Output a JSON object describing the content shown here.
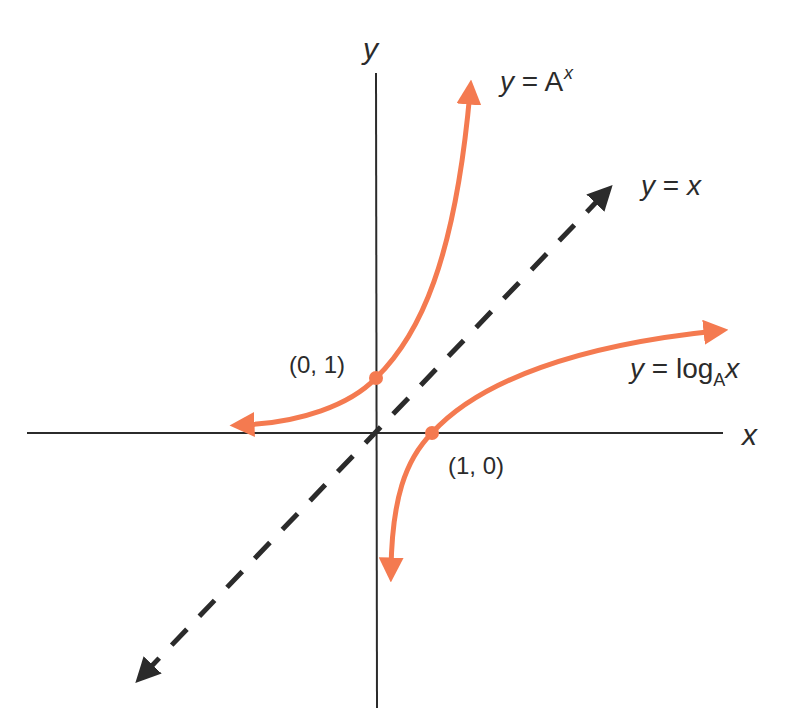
{
  "diagram": {
    "axes": {
      "x_label": "x",
      "y_label": "y"
    },
    "curves": [
      {
        "name": "exponential",
        "label_lhs": "y",
        "label_eq": " = ",
        "label_base": "A",
        "label_exp": "x",
        "color": "#f47a50"
      },
      {
        "name": "identity",
        "label_lhs": "y",
        "label_eq": " = ",
        "label_rhs": "x",
        "color": "#2b2b2b",
        "style": "dashed"
      },
      {
        "name": "logarithm",
        "label_lhs": "y",
        "label_eq": " = ",
        "label_fn": "log",
        "label_base": "A",
        "label_arg": "x",
        "color": "#f47a50"
      }
    ],
    "points": [
      {
        "label": "(0, 1)",
        "x": 0,
        "y": 1
      },
      {
        "label": "(1, 0)",
        "x": 1,
        "y": 0
      }
    ],
    "colors": {
      "curve": "#f47a50",
      "axis": "#2b2b2b",
      "text": "#2b2b2b",
      "background": "#ffffff"
    }
  }
}
